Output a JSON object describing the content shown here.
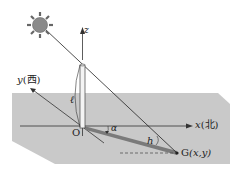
{
  "diagram": {
    "labels": {
      "z_axis": "z",
      "x_axis": "x",
      "x_dir": "(北)",
      "y_axis": "y",
      "y_dir": "(西)",
      "origin": "O",
      "pole_length": "ℓ",
      "angle_alpha": "α",
      "angle_h": "h",
      "point_g_name": "G",
      "point_g_coords": "(x,y)"
    },
    "colors": {
      "plane": "#c8c8c8",
      "shadow": "#7a7a7a",
      "sun": "#8a8a8a",
      "line": "#333333"
    }
  }
}
